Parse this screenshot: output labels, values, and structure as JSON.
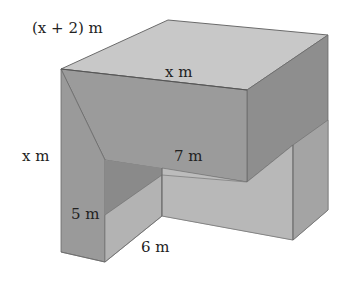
{
  "labels": {
    "top_left_width": "(x + 2) m",
    "top_depth": "x m",
    "left_height": "x m",
    "notch_depth": "7 m",
    "notch_height": "5 m",
    "notch_width": "6 m"
  },
  "colors": {
    "top_face": "#c9c9c9",
    "front_face": "#9a9a9a",
    "right_face": "#8f8f8f",
    "notch_side": "#b5b5b5",
    "notch_back": "#bdbdbd",
    "notch_left_inner": "#8c8c8c",
    "edge": "#6b6b6b"
  }
}
